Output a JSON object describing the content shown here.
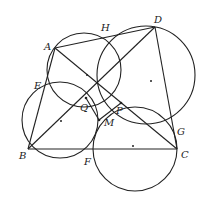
{
  "diagram": {
    "type": "geometry",
    "points": {
      "A": {
        "label": "A",
        "x": 55,
        "y": 48
      },
      "H": {
        "label": "H",
        "x": 106,
        "y": 35
      },
      "D": {
        "label": "D",
        "x": 155,
        "y": 27
      },
      "E": {
        "label": "E",
        "x": 44,
        "y": 85
      },
      "Q": {
        "label": "Q",
        "x": 86,
        "y": 98
      },
      "P": {
        "label": "P",
        "x": 121,
        "y": 103
      },
      "M": {
        "label": "M",
        "x": 99,
        "y": 120
      },
      "B": {
        "label": "B",
        "x": 28,
        "y": 149
      },
      "F": {
        "label": "F",
        "x": 91,
        "y": 149
      },
      "C": {
        "label": "C",
        "x": 177,
        "y": 149
      },
      "G": {
        "label": "G",
        "x": 174,
        "y": 131
      }
    },
    "segments": [
      "AD",
      "AB",
      "BC",
      "CD",
      "AC",
      "BD",
      "DH"
    ],
    "circles": [
      {
        "name": "circle-AEQH",
        "cx": 84,
        "cy": 70,
        "r": 37
      },
      {
        "name": "circle-HDG",
        "cx": 146,
        "cy": 75,
        "r": 49
      },
      {
        "name": "circle-BEF",
        "cx": 60,
        "cy": 120,
        "r": 38
      },
      {
        "name": "circle-FCG",
        "cx": 135,
        "cy": 149,
        "r": 42
      }
    ],
    "center_dots": [
      {
        "x": 87,
        "y": 75
      },
      {
        "x": 151,
        "y": 81
      },
      {
        "x": 61,
        "y": 121
      },
      {
        "x": 133,
        "y": 146
      }
    ]
  }
}
